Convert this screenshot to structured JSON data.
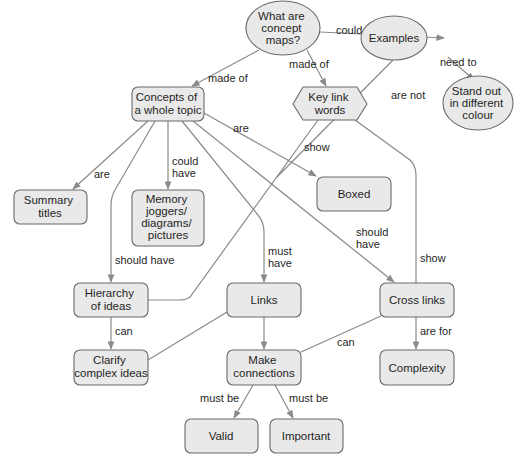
{
  "title": "What are concept maps?",
  "colors": {
    "node_fill": "#e9e9e9",
    "node_stroke": "#6b6b6b",
    "edge": "#8a8a8a",
    "text": "#1f1f1f",
    "background": "#ffffff"
  },
  "nodes": {
    "root": {
      "shape": "ellipse",
      "lines": [
        "What are",
        "concept",
        "maps?"
      ]
    },
    "examples": {
      "shape": "ellipse",
      "lines": [
        "Examples"
      ]
    },
    "stand_out": {
      "shape": "ellipse",
      "lines": [
        "Stand out",
        "in different",
        "colour"
      ]
    },
    "concepts": {
      "shape": "rounded-box",
      "lines": [
        "Concepts of",
        "a whole topic"
      ]
    },
    "key_link_words": {
      "shape": "hexagon",
      "lines": [
        "Key link",
        "words"
      ]
    },
    "summary_titles": {
      "shape": "rounded-box",
      "lines": [
        "Summary",
        "titles"
      ]
    },
    "memory_joggers": {
      "shape": "rounded-box",
      "lines": [
        "Memory",
        "joggers/",
        "diagrams/",
        "pictures"
      ]
    },
    "boxed": {
      "shape": "rounded-box",
      "lines": [
        "Boxed"
      ]
    },
    "hierarchy": {
      "shape": "rounded-box",
      "lines": [
        "Hierarchy",
        "of ideas"
      ]
    },
    "links": {
      "shape": "rounded-box",
      "lines": [
        "Links"
      ]
    },
    "cross_links": {
      "shape": "rounded-box",
      "lines": [
        "Cross links"
      ]
    },
    "clarify": {
      "shape": "rounded-box",
      "lines": [
        "Clarify",
        "complex ideas"
      ]
    },
    "make_connections": {
      "shape": "rounded-box",
      "lines": [
        "Make",
        "connections"
      ]
    },
    "complexity": {
      "shape": "rounded-box",
      "lines": [
        "Complexity"
      ]
    },
    "valid": {
      "shape": "rounded-box",
      "lines": [
        "Valid"
      ]
    },
    "important": {
      "shape": "rounded-box",
      "lines": [
        "Important"
      ]
    }
  },
  "edges": [
    {
      "from": "root",
      "to": "examples",
      "label": [
        "could include"
      ]
    },
    {
      "from": "examples",
      "to": "stand_out",
      "label": [
        "need to"
      ]
    },
    {
      "from": "root",
      "to": "concepts",
      "label": [
        "made of"
      ]
    },
    {
      "from": "root",
      "to": "key_link_words",
      "label": [
        "made of"
      ]
    },
    {
      "from": "examples",
      "to": "boxed",
      "label": [
        "are not"
      ]
    },
    {
      "from": "concepts",
      "to": "summary_titles",
      "label": [
        "are"
      ]
    },
    {
      "from": "concepts",
      "to": "memory_joggers",
      "label": [
        "could",
        "have"
      ]
    },
    {
      "from": "concepts",
      "to": "boxed",
      "label": [
        "are"
      ]
    },
    {
      "from": "concepts",
      "to": "hierarchy",
      "label": [
        "should have"
      ]
    },
    {
      "from": "concepts",
      "to": "links",
      "label": [
        "must",
        "have"
      ]
    },
    {
      "from": "concepts",
      "to": "cross_links",
      "label": [
        "should",
        "have"
      ]
    },
    {
      "from": "key_link_words",
      "to": "hierarchy",
      "label": [
        "show"
      ]
    },
    {
      "from": "key_link_words",
      "to": "cross_links",
      "label": [
        "show"
      ]
    },
    {
      "from": "hierarchy",
      "to": "clarify",
      "label": [
        "can"
      ]
    },
    {
      "from": "links",
      "to": "clarify",
      "label": []
    },
    {
      "from": "links",
      "to": "make_connections",
      "label": []
    },
    {
      "from": "cross_links",
      "to": "make_connections",
      "label": [
        "can"
      ]
    },
    {
      "from": "cross_links",
      "to": "complexity",
      "label": [
        "are for"
      ]
    },
    {
      "from": "make_connections",
      "to": "valid",
      "label": [
        "must be"
      ]
    },
    {
      "from": "make_connections",
      "to": "important",
      "label": [
        "must be"
      ]
    }
  ]
}
